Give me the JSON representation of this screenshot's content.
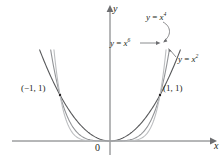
{
  "figure": {
    "name": "graphs-of-even-power-functions",
    "background_color": "#ffffff",
    "axes": {
      "x_axis_label": "x",
      "y_axis_label": "y",
      "origin_label": "0",
      "axis_color": "#6d6e71",
      "x_axis_pixel_y": 141,
      "y_axis_pixel_x": 110,
      "x_axis_start_px": 12,
      "x_axis_end_px": 213,
      "y_axis_top_px": 8,
      "y_axis_bottom_px": 155,
      "arrow_heads": [
        "x-right",
        "y-up"
      ]
    },
    "curve_labels": [
      {
        "id": "x4",
        "prefix": "y",
        "equals": " = ",
        "base": "x",
        "exponent": "4",
        "text": "y = x⁴"
      },
      {
        "id": "x6",
        "prefix": "y",
        "equals": " = ",
        "base": "x",
        "exponent": "6",
        "text": "y = x⁶"
      },
      {
        "id": "x2",
        "prefix": "y",
        "equals": " = ",
        "base": "x",
        "exponent": "2",
        "text": "y = x²"
      }
    ],
    "point_labels": [
      {
        "id": "left",
        "text": "(−1, 1)"
      },
      {
        "id": "right",
        "text": "(1, 1)"
      }
    ],
    "curves": [
      {
        "name": "y = x^2",
        "exponent": 2,
        "color": "#58595b",
        "stroke_width": 1.1
      },
      {
        "name": "y = x^4",
        "exponent": 4,
        "color": "#939598",
        "stroke_width": 1.1
      },
      {
        "name": "y = x^6",
        "exponent": 6,
        "color": "#bcbec0",
        "stroke_width": 1.1
      }
    ],
    "leaders": {
      "x6_arrow": "straight arrow pointing right toward x^6 curve",
      "x4_arrow": "curved leader hooking down-left to x^4 curve",
      "x2_arrow": "short leader up-left to x^2 curve"
    }
  },
  "chart_data": {
    "type": "line",
    "title": "",
    "xlabel": "x",
    "ylabel": "y",
    "xlim": [
      -1.42,
      1.42
    ],
    "ylim": [
      -0.12,
      1.95
    ],
    "grid": false,
    "legend": "inline curve labels",
    "annotations": [
      "(−1, 1)",
      "(1, 1)",
      "0",
      "y = x²",
      "y = x⁴",
      "y = x⁶"
    ],
    "series": [
      {
        "name": "y = x²",
        "exponent": 2,
        "color": "#58595b"
      },
      {
        "name": "y = x⁴",
        "exponent": 4,
        "color": "#939598"
      },
      {
        "name": "y = x⁶",
        "exponent": 6,
        "color": "#bcbec0"
      }
    ],
    "intersection_points": [
      [
        -1,
        1
      ],
      [
        0,
        0
      ],
      [
        1,
        1
      ]
    ]
  }
}
